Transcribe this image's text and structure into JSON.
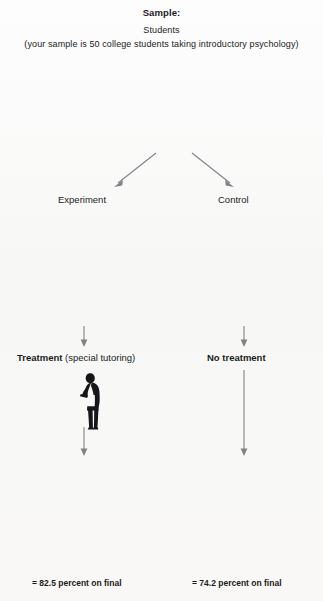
{
  "header": {
    "title": "Sample:",
    "line1": "Students",
    "line2": "(your sample is 50 college students taking introductory psychology)"
  },
  "groups": {
    "experiment_label": "Experiment",
    "control_label": "Control"
  },
  "conditions": {
    "treatment_bold": "Treatment",
    "treatment_detail": "(special tutoring)",
    "no_treatment": "No treatment"
  },
  "results": {
    "experiment": "= 82.5 percent on final",
    "control": "= 74.2 percent on final"
  },
  "colors": {
    "salmon": "#e8847e",
    "olive": "#9dae3c",
    "teal": "#5f9e98",
    "purple": "#8d86bf",
    "sage": "#88ab7a",
    "slate": "#6d91aa",
    "arrow": "#7f8286",
    "tutor": "#15161a",
    "background": "#fbfbfa",
    "text": "#1b1b1b"
  },
  "figure_meta": {
    "sample_size": 50,
    "experiment_size": 25,
    "control_size": 25,
    "diagram_type": "experiment-flow"
  }
}
